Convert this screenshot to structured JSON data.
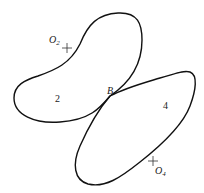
{
  "diagram": {
    "type": "cam-contact",
    "bodies": [
      {
        "id": "link-2",
        "label": "2"
      },
      {
        "id": "link-4",
        "label": "4"
      }
    ],
    "pivots": [
      {
        "id": "O2",
        "label": "O",
        "subscript": "2"
      },
      {
        "id": "O4",
        "label": "O",
        "subscript": "4"
      }
    ],
    "contact_point": {
      "label": "B"
    },
    "colors": {
      "stroke": "#111111",
      "text": "#222222",
      "background": "#ffffff"
    }
  }
}
